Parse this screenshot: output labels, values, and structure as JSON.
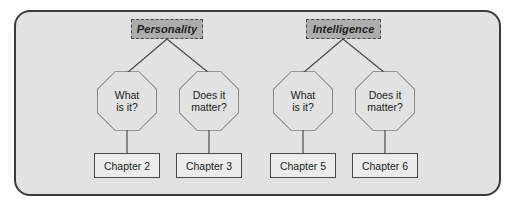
{
  "diagram": {
    "colors": {
      "panel_background": "#e2e2e2",
      "panel_border": "#3a3a3a",
      "header_fill": "#adadad",
      "header_border": "#4a4a4a",
      "node_fill": "#e2e2e2",
      "chapter_fill": "#ececec",
      "line": "#4a4a4a",
      "text": "#1d1d1d"
    },
    "groups": [
      {
        "id": "personality",
        "header": "Personality",
        "questions": [
          {
            "id": "personality-what",
            "line1": "What",
            "line2": "is it?",
            "chapter": "Chapter 2"
          },
          {
            "id": "personality-matter",
            "line1": "Does it",
            "line2": "matter?",
            "chapter": "Chapter 3"
          }
        ]
      },
      {
        "id": "intelligence",
        "header": "Intelligence",
        "questions": [
          {
            "id": "intelligence-what",
            "line1": "What",
            "line2": "is it?",
            "chapter": "Chapter 5"
          },
          {
            "id": "intelligence-matter",
            "line1": "Does it",
            "line2": "matter?",
            "chapter": "Chapter 6"
          }
        ]
      }
    ]
  }
}
